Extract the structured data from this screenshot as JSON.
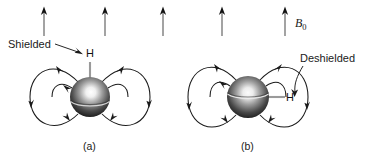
{
  "figure": {
    "background_color": "#ffffff",
    "external_field": {
      "label": "B",
      "label_subscript": "0",
      "arrow_color": "#8c8c8c",
      "arrowhead_color": "#111111",
      "direction": "up",
      "count": 5,
      "x_positions": [
        44,
        105,
        163,
        222,
        285
      ],
      "top_y": 8,
      "bottom_y": 36
    },
    "panels": [
      {
        "id": "a",
        "caption": "(a)",
        "caption_x": 93,
        "caption_y": 150,
        "annotation": "Shielded",
        "annotation_x": 8,
        "annotation_y": 48,
        "nucleus_label": "H",
        "nucleus_label_x": 86,
        "nucleus_label_y": 57,
        "sphere": {
          "cx": 90,
          "cy": 97,
          "r": 20
        },
        "bond_orientation": "vertical",
        "field_loop_color": "#1a1a1a"
      },
      {
        "id": "b",
        "caption": "(b)",
        "caption_x": 251,
        "caption_y": 150,
        "annotation": "Deshielded",
        "annotation_x": 301,
        "annotation_y": 62,
        "nucleus_label": "H",
        "nucleus_label_x": 288,
        "nucleus_label_y": 101,
        "sphere": {
          "cx": 248,
          "cy": 97,
          "r": 21
        },
        "bond_orientation": "horizontal",
        "field_loop_color": "#1a1a1a"
      }
    ],
    "colors": {
      "line": "#1a1a1a",
      "field_arrow_shaft": "#8c8c8c",
      "bond": "#9a9a9a",
      "sphere_dark": "#171717",
      "sphere_mid": "#6e6e6e",
      "sphere_light": "#f2f2f2",
      "text": "#1a1a1a"
    }
  }
}
